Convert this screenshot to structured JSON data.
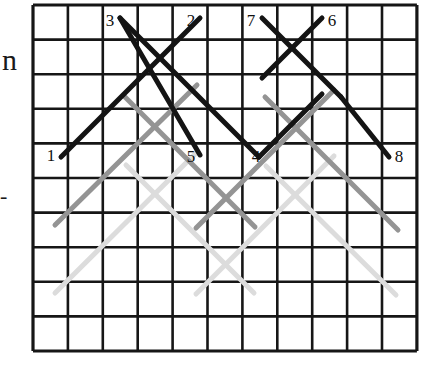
{
  "figure": {
    "background_color": "#ffffff"
  },
  "grid": {
    "name": "square-lattice",
    "columns": 11,
    "rows": 10,
    "x0": 33,
    "y0": 5,
    "cell_width": 34.9,
    "cell_height": 34.6,
    "line_color": "#161616",
    "line_width": 2.6,
    "border_width": 3.2
  },
  "margin_marks": [
    {
      "name": "left-partial-letter",
      "text": "n",
      "x": 2,
      "y": 70,
      "font_size": 30
    },
    {
      "name": "left-dash-mark",
      "text": "-",
      "x": 0,
      "y": 203,
      "font_size": 22
    }
  ],
  "palette": {
    "black": "#141414",
    "gray_medium": "#949494",
    "gray_light": "#dcdcdc"
  },
  "labels": [
    {
      "name": "endpoint-label-3",
      "text": "3",
      "x": 110,
      "y": 26,
      "anchor": "middle"
    },
    {
      "name": "endpoint-label-2",
      "text": "2",
      "x": 191,
      "y": 26,
      "anchor": "middle"
    },
    {
      "name": "endpoint-label-7",
      "text": "7",
      "x": 251,
      "y": 26,
      "anchor": "middle"
    },
    {
      "name": "endpoint-label-6",
      "text": "6",
      "x": 332,
      "y": 26,
      "anchor": "middle"
    },
    {
      "name": "endpoint-label-1",
      "text": "1",
      "x": 51,
      "y": 161,
      "anchor": "middle"
    },
    {
      "name": "endpoint-label-5",
      "text": "5",
      "x": 191,
      "y": 162,
      "anchor": "middle"
    },
    {
      "name": "endpoint-label-4",
      "text": "4",
      "x": 256,
      "y": 162,
      "anchor": "middle"
    },
    {
      "name": "endpoint-label-8",
      "text": "8",
      "x": 399,
      "y": 162,
      "anchor": "middle"
    }
  ],
  "segments": [
    {
      "name": "segment-black-1-to-2",
      "tone": "black",
      "color": "#141414",
      "width": 5.0,
      "x1": 61,
      "y1": 157,
      "x2": 200,
      "y2": 18
    },
    {
      "name": "segment-black-3-to-5",
      "tone": "black",
      "color": "#141414",
      "width": 5.0,
      "x1": 120,
      "y1": 18,
      "x2": 200,
      "y2": 155
    },
    {
      "name": "segment-black-3-to-4-long",
      "tone": "black",
      "color": "#141414",
      "width": 5.0,
      "x1": 120,
      "y1": 18,
      "x2": 259,
      "y2": 157
    },
    {
      "name": "segment-black-7-to-6cross",
      "tone": "black",
      "color": "#141414",
      "width": 5.0,
      "x1": 262,
      "y1": 18,
      "x2": 341,
      "y2": 97
    },
    {
      "name": "segment-black-6-to-8",
      "tone": "black",
      "color": "#141414",
      "width": 5.0,
      "x1": 341,
      "y1": 97,
      "x2": 389,
      "y2": 157
    },
    {
      "name": "segment-black-6-origin",
      "tone": "black",
      "color": "#141414",
      "width": 5.0,
      "x1": 322,
      "y1": 18,
      "x2": 262,
      "y2": 78
    },
    {
      "name": "segment-black-4-rise",
      "tone": "black",
      "color": "#141414",
      "width": 5.0,
      "x1": 259,
      "y1": 157,
      "x2": 322,
      "y2": 94
    },
    {
      "name": "segment-gray-left-up",
      "tone": "gray_medium",
      "color": "#949494",
      "width": 5.0,
      "x1": 55,
      "y1": 225,
      "x2": 197,
      "y2": 85
    },
    {
      "name": "segment-gray-left-down",
      "tone": "gray_medium",
      "color": "#949494",
      "width": 5.0,
      "x1": 125,
      "y1": 97,
      "x2": 255,
      "y2": 227
    },
    {
      "name": "segment-gray-right-up",
      "tone": "gray_medium",
      "color": "#949494",
      "width": 5.0,
      "x1": 196,
      "y1": 228,
      "x2": 334,
      "y2": 90
    },
    {
      "name": "segment-gray-right-down",
      "tone": "gray_medium",
      "color": "#949494",
      "width": 5.0,
      "x1": 265,
      "y1": 97,
      "x2": 398,
      "y2": 230
    },
    {
      "name": "segment-light-left-up",
      "tone": "gray_light",
      "color": "#dcdcdc",
      "width": 5.0,
      "x1": 55,
      "y1": 293,
      "x2": 197,
      "y2": 152
    },
    {
      "name": "segment-light-left-down",
      "tone": "gray_light",
      "color": "#dcdcdc",
      "width": 5.0,
      "x1": 126,
      "y1": 165,
      "x2": 254,
      "y2": 293
    },
    {
      "name": "segment-light-right-up",
      "tone": "gray_light",
      "color": "#dcdcdc",
      "width": 5.0,
      "x1": 196,
      "y1": 294,
      "x2": 334,
      "y2": 156
    },
    {
      "name": "segment-light-right-down",
      "tone": "gray_light",
      "color": "#dcdcdc",
      "width": 5.0,
      "x1": 266,
      "y1": 166,
      "x2": 396,
      "y2": 295
    }
  ]
}
